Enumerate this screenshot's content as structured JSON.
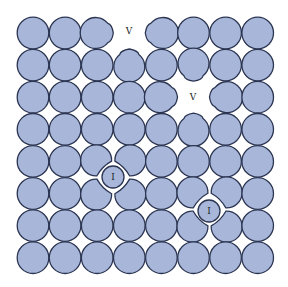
{
  "diagram": {
    "title": "",
    "colors": {
      "atom_fill": "#a8b7d9",
      "atom_stroke": "#2b3552",
      "label": "#222222",
      "background": "#ffffff"
    },
    "grid": {
      "rows": 8,
      "cols": 8,
      "origin_x": 33,
      "origin_y": 33,
      "spacing": 32.1,
      "radius": 15.8
    },
    "defects": [
      {
        "type": "vacancy",
        "label": "V",
        "row": 0,
        "col": 3,
        "x": 129,
        "y": 31
      },
      {
        "type": "vacancy",
        "label": "V",
        "row": 2,
        "col": 5,
        "x": 193,
        "y": 97
      },
      {
        "type": "interstitial",
        "label": "I",
        "x": 113,
        "y": 177,
        "r": 11
      },
      {
        "type": "interstitial",
        "label": "I",
        "x": 209,
        "y": 211,
        "r": 11
      }
    ],
    "deformed_atoms": [
      {
        "row": 0,
        "col": 2,
        "shape": "teardrop",
        "points_to": "right"
      },
      {
        "row": 0,
        "col": 4,
        "shape": "teardrop",
        "points_to": "left"
      },
      {
        "row": 1,
        "col": 3,
        "shape": "teardrop",
        "points_to": "up"
      },
      {
        "row": 1,
        "col": 5,
        "shape": "teardrop",
        "points_to": "down"
      },
      {
        "row": 2,
        "col": 4,
        "shape": "teardrop",
        "points_to": "right"
      },
      {
        "row": 2,
        "col": 6,
        "shape": "teardrop",
        "points_to": "left"
      },
      {
        "row": 3,
        "col": 5,
        "shape": "teardrop",
        "points_to": "up"
      },
      {
        "row": 4,
        "col": 2,
        "shape": "squished",
        "away_from": "bottom-right"
      },
      {
        "row": 4,
        "col": 3,
        "shape": "squished",
        "away_from": "bottom-left"
      },
      {
        "row": 5,
        "col": 2,
        "shape": "squished",
        "away_from": "top-right"
      },
      {
        "row": 5,
        "col": 3,
        "shape": "squished",
        "away_from": "top-left"
      },
      {
        "row": 5,
        "col": 5,
        "shape": "squished",
        "away_from": "bottom-right"
      },
      {
        "row": 5,
        "col": 6,
        "shape": "squished",
        "away_from": "bottom-left"
      },
      {
        "row": 6,
        "col": 5,
        "shape": "squished",
        "away_from": "top-right"
      },
      {
        "row": 6,
        "col": 6,
        "shape": "squished",
        "away_from": "top-left"
      }
    ],
    "labels": {
      "vacancy_1": "V",
      "vacancy_2": "V",
      "interstitial_1": "I",
      "interstitial_2": "I"
    }
  }
}
